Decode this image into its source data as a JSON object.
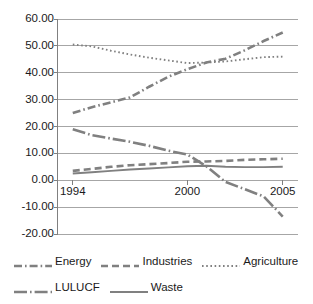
{
  "chart_data": {
    "type": "line",
    "title": "",
    "xlabel": "",
    "ylabel": "",
    "xlim": [
      1993.2,
      2005.8
    ],
    "ylim": [
      -20,
      60
    ],
    "grid": true,
    "legend_position": "bottom",
    "y_ticks": [
      "60.00",
      "50.00",
      "40.00",
      "30.00",
      "20.00",
      "10.00",
      "0.00",
      "-10.00",
      "-20.00"
    ],
    "y_tick_values": [
      60,
      50,
      40,
      30,
      20,
      10,
      0,
      -10,
      -20
    ],
    "x_ticks": [
      "1994",
      "2000",
      "2005"
    ],
    "x_tick_values": [
      1994,
      2000,
      2005
    ],
    "x": [
      1994,
      1995,
      1996,
      1997,
      1998,
      1999,
      2000,
      2001,
      2002,
      2003,
      2004,
      2005
    ],
    "series": [
      {
        "name": "Energy",
        "style": "dash-dot",
        "color": "#808080",
        "values": [
          25.0,
          27.2,
          29.0,
          30.8,
          34.8,
          38.5,
          41.3,
          43.8,
          45.2,
          48.3,
          51.8,
          55.0
        ]
      },
      {
        "name": "Industries",
        "style": "dashed",
        "color": "#808080",
        "values": [
          3.5,
          4.2,
          5.0,
          5.6,
          6.0,
          6.4,
          6.9,
          7.0,
          7.2,
          7.6,
          7.8,
          8.0
        ]
      },
      {
        "name": "Agriculture",
        "style": "dotted",
        "color": "#808080",
        "values": [
          50.5,
          49.8,
          48.2,
          46.8,
          45.6,
          44.6,
          43.6,
          43.8,
          44.2,
          45.0,
          45.8,
          46.0
        ]
      },
      {
        "name": "LULUCF",
        "style": "long-dash-dot",
        "color": "#808080",
        "values": [
          19.0,
          16.8,
          15.5,
          14.3,
          12.8,
          11.0,
          9.6,
          5.2,
          -0.6,
          -3.3,
          -6.0,
          -13.5
        ]
      },
      {
        "name": "Waste",
        "style": "solid",
        "color": "#808080",
        "values": [
          2.5,
          3.0,
          3.5,
          4.0,
          4.4,
          4.8,
          5.2,
          5.4,
          5.0,
          4.9,
          4.9,
          5.0
        ]
      }
    ]
  },
  "legend": {
    "rows": [
      [
        {
          "label": "Energy",
          "swatch": "dash-dot"
        },
        {
          "label": "Industries",
          "swatch": "dashed"
        },
        {
          "label": "Agriculture",
          "swatch": "dotted"
        }
      ],
      [
        {
          "label": "LULUCF",
          "swatch": "long-dash-dot"
        },
        {
          "label": "Waste",
          "swatch": "solid"
        }
      ]
    ]
  },
  "colors": {
    "line": "#808080",
    "grid": "#a6a6a6",
    "axis": "#808080",
    "text": "#1a1a1a",
    "background": "#ffffff"
  }
}
